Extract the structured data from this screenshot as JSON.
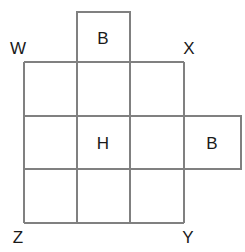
{
  "figure": {
    "background_color": "#ffffff",
    "stroke_color": "#808080",
    "label_color": "#1a1a1a",
    "stroke_width": 1.1
  },
  "grid": {
    "columns": 3,
    "rows": 3,
    "x_lines": [
      24,
      77,
      130,
      184
    ],
    "y_lines": [
      62,
      116,
      169,
      223
    ]
  },
  "flaps": [
    {
      "name": "top-flap",
      "label": "B",
      "x": 77,
      "y": 12,
      "width": 53,
      "height": 50,
      "label_x": 103,
      "label_y": 38
    },
    {
      "name": "right-flap",
      "label": "B",
      "x": 184,
      "y": 116,
      "width": 57,
      "height": 53,
      "label_x": 212,
      "label_y": 143
    }
  ],
  "cell_labels": [
    {
      "name": "center-cell-label",
      "text": "H",
      "x": 103,
      "y": 143
    }
  ],
  "vertex_labels": [
    {
      "name": "vertex-label-w",
      "text": "W",
      "x": 18,
      "y": 48
    },
    {
      "name": "vertex-label-x",
      "text": "X",
      "x": 189,
      "y": 48
    },
    {
      "name": "vertex-label-z",
      "text": "Z",
      "x": 18,
      "y": 237
    },
    {
      "name": "vertex-label-y",
      "text": "Y",
      "x": 188,
      "y": 237
    }
  ]
}
